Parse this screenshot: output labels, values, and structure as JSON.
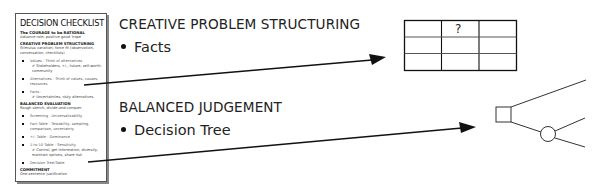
{
  "checklist": {
    "title": "DECISION CHECKLIST",
    "sections": [
      {
        "heading": "The COURAGE to be RATIONAL",
        "text": "Advance role; positive good 'hope'"
      },
      {
        "heading": "CREATIVE PROBLEM STRUCTURING",
        "text": "Stimulus variation; force fit (observation, conversation, checklists)"
      }
    ],
    "structuring_items": [
      {
        "label": "Values - Think of alternatives",
        "sub": "✔ Stakeholders, +/-, future, self-worth; community"
      },
      {
        "label": "Alternatives - Think of values, causes, resources",
        "sub": ""
      },
      {
        "label": "Facts -",
        "sub": "✔ Uncertainties, risky alternatives"
      }
    ],
    "evaluation": {
      "heading": "BALANCED EVALUATION",
      "text": "Rough sketch, divide-and-conquer"
    },
    "evaluation_items": [
      {
        "label": "Screening - Universalizability",
        "sub": ""
      },
      {
        "label": "Fact Table - Testability, sampling, comparison, uncertainty",
        "sub": ""
      },
      {
        "label": "+/- Table - Dominance",
        "sub": ""
      },
      {
        "label": "1-to-10 Table - Sensitivity",
        "sub": "✔ Control, get information, diversify, maintain options, share risk"
      },
      {
        "label": "Decision Tree/Table",
        "sub": ""
      }
    ],
    "commitment": {
      "heading": "COMMITMENT",
      "text": "One-sentence justification"
    }
  },
  "main": {
    "section1": {
      "heading": "CREATIVE PROBLEM STRUCTURING",
      "bullet": "Facts"
    },
    "section2": {
      "heading": "BALANCED JUDGEMENT",
      "bullet": "Decision Tree"
    }
  },
  "fact_table": {
    "rows": 3,
    "cols": 3,
    "cells": [
      [
        "",
        "?",
        ""
      ],
      [
        "",
        "",
        ""
      ],
      [
        "",
        "",
        ""
      ]
    ]
  },
  "decision_tree": {
    "nodes": [
      {
        "type": "decision",
        "shape": "square"
      },
      {
        "type": "chance",
        "shape": "circle"
      }
    ]
  }
}
